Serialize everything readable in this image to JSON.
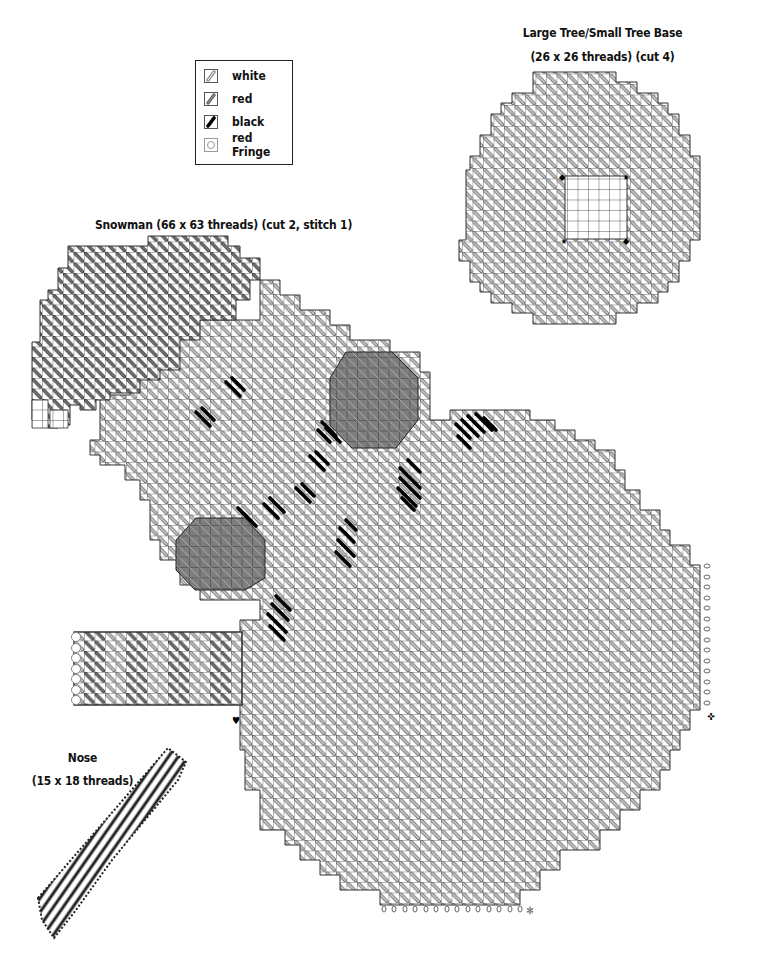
{
  "legend": {
    "items": [
      {
        "label": "white",
        "icon": "white-stitch-icon",
        "color": "#bdbdbd"
      },
      {
        "label": "red",
        "icon": "red-stitch-icon",
        "color": "#7a7a7a"
      },
      {
        "label": "black",
        "icon": "black-stitch-icon",
        "color": "#111111"
      },
      {
        "label": "red Fringe",
        "icon": "fringe-circle-icon",
        "color": "#9a9a9a"
      }
    ]
  },
  "pieces": {
    "tree_base": {
      "title": "Large Tree/Small Tree Base",
      "subtitle": "(26 x 26 threads) (cut 4)"
    },
    "snowman": {
      "title": "Snowman (66 x 63 threads) (cut 2, stitch 1)"
    },
    "nose": {
      "title": "Nose",
      "subtitle": "(15 x 18 threads)"
    }
  },
  "symbols": {
    "heart": "♥",
    "star": "★",
    "diamond": "◆",
    "cross": "✜",
    "asterisk": "✻"
  }
}
